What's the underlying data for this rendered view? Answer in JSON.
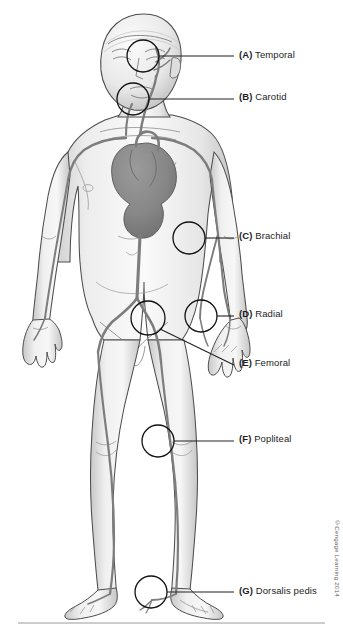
{
  "figure": {
    "credit": "©Cengage Learning 2014",
    "colors": {
      "artery": "#7d7d7d",
      "artery_dark": "#6b6b6b",
      "heart": "#8a8a8a",
      "skin_light": "#f2f2f2",
      "skin_shade": "#c9c9c9",
      "outline": "#4a4a4a",
      "marker_circle": "#111111",
      "leader_line": "#222222",
      "label_text": "#1d1d1d",
      "background": "#ffffff",
      "rule": "#9a9a9a"
    }
  },
  "labels": [
    {
      "key": "(A)",
      "term": "Temporal",
      "x": 239,
      "y": 50,
      "circle": {
        "cx": 143,
        "cy": 56,
        "r": 16
      },
      "leader": {
        "x1": 159,
        "y1": 56,
        "x2": 234,
        "y2": 56
      }
    },
    {
      "key": "(B)",
      "term": "Carotid",
      "x": 239,
      "y": 92,
      "circle": {
        "cx": 133,
        "cy": 99,
        "r": 16
      },
      "leader": {
        "x1": 149,
        "y1": 99,
        "x2": 234,
        "y2": 99
      }
    },
    {
      "key": "(C)",
      "term": "Brachial",
      "x": 239,
      "y": 231,
      "circle": {
        "cx": 189,
        "cy": 238,
        "r": 16
      },
      "leader": {
        "x1": 205,
        "y1": 238,
        "x2": 234,
        "y2": 238
      }
    },
    {
      "key": "(D)",
      "term": "Radial",
      "x": 239,
      "y": 309,
      "circle": {
        "cx": 201,
        "cy": 316,
        "r": 16
      },
      "leader": {
        "x1": 217,
        "y1": 316,
        "x2": 234,
        "y2": 316
      }
    },
    {
      "key": "(E)",
      "term": "Femoral",
      "x": 239,
      "y": 358,
      "circle": {
        "cx": 148,
        "cy": 318,
        "r": 17
      },
      "leader": {
        "x1": 160,
        "y1": 329,
        "x2": 234,
        "y2": 365
      }
    },
    {
      "key": "(F)",
      "term": "Popliteal",
      "x": 239,
      "y": 434,
      "circle": {
        "cx": 158,
        "cy": 441,
        "r": 16
      },
      "leader": {
        "x1": 174,
        "y1": 441,
        "x2": 234,
        "y2": 441
      }
    },
    {
      "key": "(G)",
      "term": "Dorsalis pedis",
      "x": 239,
      "y": 586,
      "circle": {
        "cx": 151,
        "cy": 592,
        "r": 16
      },
      "leader": {
        "x1": 167,
        "y1": 592,
        "x2": 234,
        "y2": 592
      }
    }
  ],
  "bottom_rule": {
    "x1": 18,
    "y1": 623,
    "x2": 325,
    "y2": 623
  }
}
